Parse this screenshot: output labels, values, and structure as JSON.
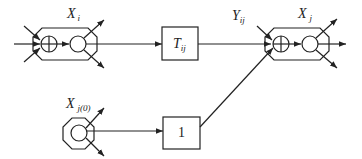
{
  "diagram": {
    "nodes": {
      "xi": {
        "label": "X",
        "sub": "i"
      },
      "xj": {
        "label": "X",
        "sub": "j"
      },
      "xj0": {
        "label": "X",
        "sub": "j(0)"
      }
    },
    "blocks": {
      "tij": {
        "label": "T",
        "sub": "ij"
      },
      "one": {
        "label": "1"
      }
    },
    "edges": {
      "yij": {
        "label": "Y",
        "sub": "ij"
      }
    },
    "colors": {
      "stroke": "#222222",
      "background": "#ffffff"
    }
  }
}
